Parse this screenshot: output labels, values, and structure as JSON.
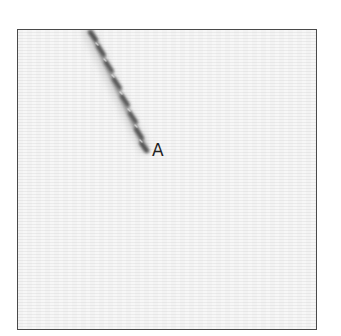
{
  "figure": {
    "panel_label": "A",
    "border_color": "#4a4a4a",
    "background_color": "#f3f3f3",
    "strand": {
      "description": "twisted helical filament",
      "color_dark": "#3a3a3a",
      "color_light": "#9a9a9a",
      "start": [
        73,
        0
      ],
      "end": [
        130,
        123
      ]
    }
  }
}
